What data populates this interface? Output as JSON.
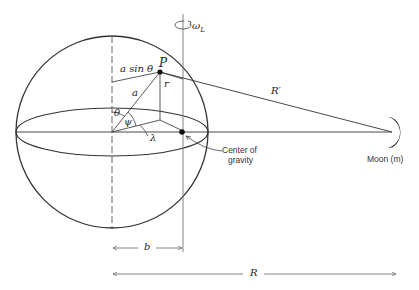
{
  "diagram": {
    "type": "earth-moon tidal geometry",
    "labels": {
      "omega": "ω",
      "omega_sub": "L",
      "a_sin_theta": "a sin θ",
      "P": "P",
      "r": "r",
      "a": "a",
      "R_prime": "R′",
      "theta": "θ",
      "psi": "ψ",
      "lambda": "λ",
      "center_of_gravity_line1": "Center of",
      "center_of_gravity_line2": "gravity",
      "moon": "Moon (m)",
      "b": "b",
      "R": "R"
    },
    "colors": {
      "line": "#333333",
      "light_line": "#777777"
    }
  }
}
